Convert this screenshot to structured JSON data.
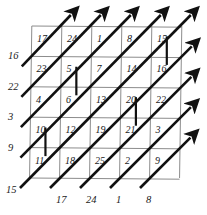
{
  "figure": {
    "type": "grid-diagram",
    "grid": {
      "rows": 5,
      "cols": 5,
      "x": 30,
      "y": 26,
      "w": 150,
      "h": 152
    },
    "colors": {
      "grid_line": "#8c8c8c",
      "arrow": "#111111",
      "text": "#1a1a1a",
      "background": "#ffffff"
    }
  },
  "cells": [
    {
      "label": "17",
      "row": 0,
      "col": 0
    },
    {
      "label": "24",
      "row": 0,
      "col": 1
    },
    {
      "label": "1",
      "row": 0,
      "col": 2
    },
    {
      "label": "8",
      "row": 0,
      "col": 3
    },
    {
      "label": "15",
      "row": 0,
      "col": 4
    },
    {
      "label": "23",
      "row": 1,
      "col": 0
    },
    {
      "label": "5",
      "row": 1,
      "col": 1
    },
    {
      "label": "7",
      "row": 1,
      "col": 2
    },
    {
      "label": "14",
      "row": 1,
      "col": 3
    },
    {
      "label": "16",
      "row": 1,
      "col": 4
    },
    {
      "label": "4",
      "row": 2,
      "col": 0
    },
    {
      "label": "6",
      "row": 2,
      "col": 1
    },
    {
      "label": "13",
      "row": 2,
      "col": 2
    },
    {
      "label": "20",
      "row": 2,
      "col": 3
    },
    {
      "label": "22",
      "row": 2,
      "col": 4
    },
    {
      "label": "10",
      "row": 3,
      "col": 0
    },
    {
      "label": "12",
      "row": 3,
      "col": 1
    },
    {
      "label": "19",
      "row": 3,
      "col": 2
    },
    {
      "label": "21",
      "row": 3,
      "col": 3
    },
    {
      "label": "3",
      "row": 3,
      "col": 4
    },
    {
      "label": "11",
      "row": 4,
      "col": 0
    },
    {
      "label": "18",
      "row": 4,
      "col": 1
    },
    {
      "label": "25",
      "row": 4,
      "col": 2
    },
    {
      "label": "2",
      "row": 4,
      "col": 3
    },
    {
      "label": "9",
      "row": 4,
      "col": 4
    }
  ],
  "left_labels": [
    "16",
    "22",
    "3",
    "9",
    "15"
  ],
  "bottom_labels": [
    "17",
    "24",
    "1",
    "8"
  ],
  "vertical_connectors": [
    {
      "from": "5",
      "to": "6"
    },
    {
      "from": "15",
      "to": "16"
    },
    {
      "from": "20",
      "to": "21"
    },
    {
      "from": "10",
      "to": "11"
    }
  ]
}
